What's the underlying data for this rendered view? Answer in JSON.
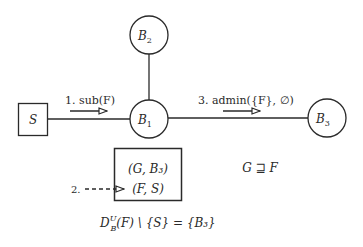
{
  "diagram": {
    "nodes": {
      "S": {
        "label": "S",
        "shape": "square"
      },
      "B1": {
        "label": "B",
        "sub": "1",
        "shape": "circle"
      },
      "B2": {
        "label": "B",
        "sub": "2",
        "shape": "circle"
      },
      "B3": {
        "label": "B",
        "sub": "3",
        "shape": "circle"
      }
    },
    "edges": [
      {
        "from": "S",
        "to": "B1"
      },
      {
        "from": "B2",
        "to": "B1"
      },
      {
        "from": "B1",
        "to": "B3"
      }
    ],
    "messages": {
      "step1": "1. sub(F)",
      "step2": "2.",
      "step3": "3. admin({F}, ∅)"
    },
    "table": {
      "rows": [
        "(G, B₃)",
        "(F, S)"
      ]
    },
    "relation": "G ⊒ F",
    "formula": {
      "D": "D",
      "sup": "U",
      "sub": "B",
      "rest": "(F) \\ {S} = {B₃}"
    },
    "colors": {
      "ink": "#2a2a2a",
      "background": "#ffffff"
    }
  }
}
